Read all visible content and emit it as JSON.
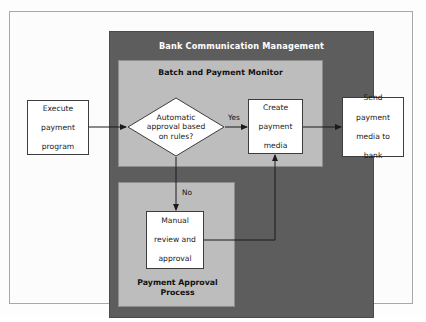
{
  "diagram": {
    "title": "Bank Communication Management",
    "containers": {
      "outer": {
        "label": "Bank Communication Management",
        "color": "#5d5d5d"
      },
      "batch_monitor": {
        "label": "Batch and Payment Monitor",
        "color": "#bdbdbd"
      },
      "payment_approval": {
        "label": "Payment Approval Process",
        "color": "#bdbdbd"
      }
    },
    "nodes": [
      {
        "id": "execute-payment-program",
        "type": "process",
        "label": "Execute payment program",
        "lines": [
          "Execute",
          "payment",
          "program"
        ],
        "container": "none"
      },
      {
        "id": "automatic-approval-decision",
        "type": "decision",
        "label": "Automatic approval based on rules?",
        "lines": [
          "Automatic",
          "approval based",
          "on rules?"
        ],
        "container": "batch_monitor"
      },
      {
        "id": "create-payment-media",
        "type": "process",
        "label": "Create payment media",
        "lines": [
          "Create",
          "payment",
          "media"
        ],
        "container": "batch_monitor"
      },
      {
        "id": "send-payment-media-to-bank",
        "type": "process",
        "label": "Send payment media to bank",
        "lines": [
          "Send",
          "payment",
          "media to",
          "bank"
        ],
        "container": "outer"
      },
      {
        "id": "manual-review-and-approval",
        "type": "process",
        "label": "Manual review and approval",
        "lines": [
          "Manual",
          "review and",
          "approval"
        ],
        "container": "payment_approval"
      }
    ],
    "edges": [
      {
        "id": "execute-to-decision",
        "from": "execute-payment-program",
        "to": "automatic-approval-decision",
        "label": ""
      },
      {
        "id": "decision-yes-to-create",
        "from": "automatic-approval-decision",
        "to": "create-payment-media",
        "label": "Yes"
      },
      {
        "id": "decision-no-to-manual",
        "from": "automatic-approval-decision",
        "to": "manual-review-and-approval",
        "label": "No"
      },
      {
        "id": "manual-to-create",
        "from": "manual-review-and-approval",
        "to": "create-payment-media",
        "label": ""
      },
      {
        "id": "create-to-send",
        "from": "create-payment-media",
        "to": "send-payment-media-to-bank",
        "label": ""
      }
    ],
    "colors": {
      "outer_panel": "#5d5d5d",
      "inner_panel": "#bdbdbd",
      "node_fill": "#ffffff",
      "node_stroke": "#3d3d3d",
      "connector": "#1a1a1a",
      "page_background": "#fdfdfd",
      "frame_border": "#a8a8a8"
    }
  }
}
